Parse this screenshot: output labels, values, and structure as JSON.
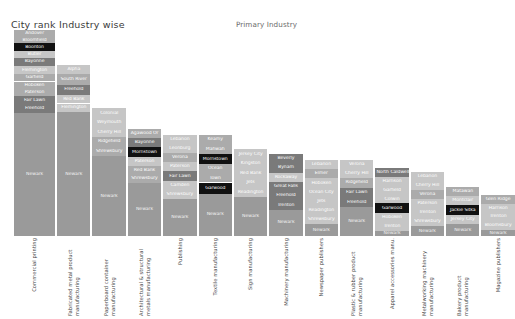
{
  "header": {
    "chart_title": "City rank Industry wise",
    "axis_title": "Primary Industry"
  },
  "chart_data": {
    "type": "bar",
    "title": "City rank Industry wise",
    "xlabel": "Primary Industry",
    "ylabel": "",
    "subtitle": "Primary Industry",
    "legend": "none",
    "grid": false,
    "note": "Stacked/mosaic column chart. Each column is one primary industry; segment heights are city shares and segment labels are city names. Column heights decline left to right.",
    "categories": [
      "Commercial printing",
      "Fabricated metal product manufacturing",
      "Paperboard container manufacturing",
      "Architectural & structural metals manufacturing",
      "Publishing",
      "Textile manufacturing",
      "Sign manufacturing",
      "Machinery manufacturing",
      "Newspaper publishers",
      "Plastic & rubber product manufacturing",
      "Apparel accessories manu.",
      "Metalworking machinery manufacturing",
      "Bakery product manufacturing",
      "Magazine publishers"
    ],
    "values": [
      100,
      83,
      62,
      52,
      49,
      49,
      42,
      40,
      37,
      37,
      33,
      31,
      24,
      20
    ],
    "ylim": [
      0,
      100
    ],
    "columns": [
      {
        "label": "Commercial printing",
        "height_pct": 100,
        "width_pct": 9.0,
        "segments": [
          {
            "city": "Andover",
            "pct": 3.4,
            "tone": "mid"
          },
          {
            "city": "Bloomfield",
            "pct": 3.0,
            "tone": "mid"
          },
          {
            "city": "Boonton",
            "pct": 4.0,
            "tone": "dark"
          },
          {
            "city": "Butler",
            "pct": 3.0,
            "tone": "light"
          },
          {
            "city": "Bayonne",
            "pct": 4.0,
            "tone": "mid-dark"
          },
          {
            "city": "Flemington",
            "pct": 4.0,
            "tone": "light"
          },
          {
            "city": "Garfield",
            "pct": 3.6,
            "tone": "mid"
          },
          {
            "city": "Hoboken",
            "pct": 3.6,
            "tone": "mid"
          },
          {
            "city": "Paterson",
            "pct": 3.6,
            "tone": "mid"
          },
          {
            "city": "Fair Lawn",
            "pct": 4.0,
            "tone": "mid-dark"
          },
          {
            "city": "Freehold",
            "pct": 4.0,
            "tone": "mid-dark"
          },
          {
            "city": "Newark",
            "pct": 59.8,
            "tone": "base"
          }
        ]
      },
      {
        "label": "Fabricated metal product manufacturing",
        "height_pct": 83,
        "width_pct": 7.3,
        "segments": [
          {
            "city": "Alpha",
            "pct": 5.0,
            "tone": "light"
          },
          {
            "city": "South River",
            "pct": 6.5,
            "tone": "mid"
          },
          {
            "city": "Freehold",
            "pct": 6.0,
            "tone": "mid-dark"
          },
          {
            "city": "Red Bank",
            "pct": 5.0,
            "tone": "light"
          },
          {
            "city": "Flemington",
            "pct": 5.0,
            "tone": "light"
          },
          {
            "city": "Newark",
            "pct": 72.5,
            "tone": "base"
          }
        ]
      },
      {
        "label": "Paperboard container manufacturing",
        "height_pct": 62,
        "width_pct": 7.3,
        "segments": [
          {
            "city": "Colonial",
            "pct": 7.5,
            "tone": "light"
          },
          {
            "city": "Weymouth",
            "pct": 7.5,
            "tone": "light"
          },
          {
            "city": "Cherry Hill",
            "pct": 7.5,
            "tone": "light"
          },
          {
            "city": "Ridgefield",
            "pct": 7.5,
            "tone": "mid"
          },
          {
            "city": "Shrewsbury",
            "pct": 7.5,
            "tone": "mid"
          },
          {
            "city": "Newark",
            "pct": 62.5,
            "tone": "base"
          }
        ]
      },
      {
        "label": "Architectural & structural metals manufacturing",
        "height_pct": 52,
        "width_pct": 7.3,
        "segments": [
          {
            "city": "Agawood Or",
            "pct": 8.5,
            "tone": "mid"
          },
          {
            "city": "Bayonne",
            "pct": 8.5,
            "tone": "mid-dark"
          },
          {
            "city": "Morristown",
            "pct": 9.0,
            "tone": "dark"
          },
          {
            "city": "Paterson",
            "pct": 8.5,
            "tone": "light"
          },
          {
            "city": "Red Bank",
            "pct": 8.0,
            "tone": "mid"
          },
          {
            "city": "Shrewsbury",
            "pct": 8.0,
            "tone": "mid"
          },
          {
            "city": "Newark",
            "pct": 49.5,
            "tone": "base"
          }
        ]
      },
      {
        "label": "Publishing",
        "height_pct": 49,
        "width_pct": 7.3,
        "segments": [
          {
            "city": "Lebanon",
            "pct": 9.0,
            "tone": "light"
          },
          {
            "city": "Leonburg",
            "pct": 9.0,
            "tone": "light"
          },
          {
            "city": "Verona",
            "pct": 9.0,
            "tone": "mid"
          },
          {
            "city": "Paterson",
            "pct": 9.0,
            "tone": "light"
          },
          {
            "city": "Fair Lawn",
            "pct": 9.5,
            "tone": "mid-dark"
          },
          {
            "city": "Camden",
            "pct": 9.0,
            "tone": "light"
          },
          {
            "city": "Shrewsbury",
            "pct": 9.0,
            "tone": "light"
          },
          {
            "city": "Newark",
            "pct": 36.5,
            "tone": "base"
          }
        ]
      },
      {
        "label": "Textile manufacturing",
        "height_pct": 49,
        "width_pct": 7.3,
        "segments": [
          {
            "city": "Keamy",
            "pct": 9.5,
            "tone": "mid"
          },
          {
            "city": "Mahwah",
            "pct": 9.5,
            "tone": "mid"
          },
          {
            "city": "Morristown",
            "pct": 10.0,
            "tone": "dark"
          },
          {
            "city": "Ocean",
            "pct": 9.0,
            "tone": "mid"
          },
          {
            "city": "Town",
            "pct": 9.0,
            "tone": "mid"
          },
          {
            "city": "Garwood",
            "pct": 11.0,
            "tone": "dark"
          },
          {
            "city": "Newark",
            "pct": 42.0,
            "tone": "base"
          }
        ]
      },
      {
        "label": "Sign manufacturing",
        "height_pct": 42,
        "width_pct": 7.3,
        "segments": [
          {
            "city": "Jersey City",
            "pct": 11.0,
            "tone": "light"
          },
          {
            "city": "Kingston",
            "pct": 11.0,
            "tone": "light"
          },
          {
            "city": "Red Bank",
            "pct": 11.0,
            "tone": "light"
          },
          {
            "city": "Jets",
            "pct": 11.0,
            "tone": "light"
          },
          {
            "city": "Readington",
            "pct": 11.0,
            "tone": "light"
          },
          {
            "city": "Newark",
            "pct": 45.0,
            "tone": "base"
          }
        ]
      },
      {
        "label": "Machinery manufacturing",
        "height_pct": 40,
        "width_pct": 7.3,
        "segments": [
          {
            "city": "Beverly",
            "pct": 11.5,
            "tone": "mid-dark"
          },
          {
            "city": "Bynam",
            "pct": 11.5,
            "tone": "mid-dark"
          },
          {
            "city": "Rockaway",
            "pct": 11.0,
            "tone": "light"
          },
          {
            "city": "Great Falls",
            "pct": 11.5,
            "tone": "mid-dark"
          },
          {
            "city": "Freehold",
            "pct": 11.5,
            "tone": "mid-dark"
          },
          {
            "city": "Trenton",
            "pct": 11.0,
            "tone": "mid-dark"
          },
          {
            "city": "Newark",
            "pct": 32.0,
            "tone": "base"
          }
        ]
      },
      {
        "label": "Newspaper publishers",
        "height_pct": 37,
        "width_pct": 7.3,
        "segments": [
          {
            "city": "Lebanon",
            "pct": 12.0,
            "tone": "light"
          },
          {
            "city": "Elmer",
            "pct": 12.5,
            "tone": "mid"
          },
          {
            "city": "Hoboken",
            "pct": 12.0,
            "tone": "light"
          },
          {
            "city": "Ocean City",
            "pct": 12.0,
            "tone": "light"
          },
          {
            "city": "Jets",
            "pct": 12.0,
            "tone": "light"
          },
          {
            "city": "Readington",
            "pct": 12.0,
            "tone": "light"
          },
          {
            "city": "Shrewsbury",
            "pct": 12.0,
            "tone": "light"
          },
          {
            "city": "Newark",
            "pct": 15.5,
            "tone": "base"
          }
        ]
      },
      {
        "label": "Plastic & rubber product manufacturing",
        "height_pct": 37,
        "width_pct": 7.3,
        "segments": [
          {
            "city": "Verona",
            "pct": 12.0,
            "tone": "light"
          },
          {
            "city": "Cherry Hill",
            "pct": 12.0,
            "tone": "light"
          },
          {
            "city": "Ridgefield",
            "pct": 12.5,
            "tone": "mid"
          },
          {
            "city": "Fair Lawn",
            "pct": 13.0,
            "tone": "mid-dark"
          },
          {
            "city": "Freehold",
            "pct": 13.0,
            "tone": "mid-dark"
          },
          {
            "city": "Newark",
            "pct": 37.5,
            "tone": "base"
          }
        ]
      },
      {
        "label": "Apparel accessories manu.",
        "height_pct": 33,
        "width_pct": 7.3,
        "segments": [
          {
            "city": "North Caldwell",
            "pct": 13.0,
            "tone": "mid-dark"
          },
          {
            "city": "Harrison",
            "pct": 13.0,
            "tone": "light"
          },
          {
            "city": "Garfield",
            "pct": 13.0,
            "tone": "light"
          },
          {
            "city": "Colwin",
            "pct": 13.0,
            "tone": "light"
          },
          {
            "city": "Garwood",
            "pct": 14.0,
            "tone": "dark"
          },
          {
            "city": "Hoboken",
            "pct": 13.0,
            "tone": "light"
          },
          {
            "city": "Trenton",
            "pct": 13.0,
            "tone": "light"
          },
          {
            "city": "Newark",
            "pct": 8.0,
            "tone": "base"
          }
        ]
      },
      {
        "label": "Metalworking machinery manufacturing",
        "height_pct": 31,
        "width_pct": 7.3,
        "segments": [
          {
            "city": "Lebanon",
            "pct": 14.0,
            "tone": "light"
          },
          {
            "city": "Cherry Hill",
            "pct": 14.0,
            "tone": "light"
          },
          {
            "city": "Verona",
            "pct": 14.5,
            "tone": "mid"
          },
          {
            "city": "Paterson",
            "pct": 14.0,
            "tone": "light"
          },
          {
            "city": "Trenton",
            "pct": 14.0,
            "tone": "light"
          },
          {
            "city": "Shrewsbury",
            "pct": 14.0,
            "tone": "light"
          },
          {
            "city": "Newark",
            "pct": 15.5,
            "tone": "base"
          }
        ]
      },
      {
        "label": "Bakery product manufacturing",
        "height_pct": 24,
        "width_pct": 7.3,
        "segments": [
          {
            "city": "Matawan",
            "pct": 19.0,
            "tone": "mid"
          },
          {
            "city": "Montclair",
            "pct": 18.5,
            "tone": "light"
          },
          {
            "city": "Jackie Sitka",
            "pct": 20.0,
            "tone": "dark"
          },
          {
            "city": "Jersey City",
            "pct": 19.0,
            "tone": "light"
          },
          {
            "city": "Newark",
            "pct": 23.5,
            "tone": "base"
          }
        ]
      },
      {
        "label": "Magazine publishers",
        "height_pct": 20,
        "width_pct": 7.3,
        "segments": [
          {
            "city": "Glen Ridge",
            "pct": 22.0,
            "tone": "mid"
          },
          {
            "city": "Harrison",
            "pct": 21.0,
            "tone": "light"
          },
          {
            "city": "Trenton",
            "pct": 21.0,
            "tone": "light"
          },
          {
            "city": "Bloomsbury",
            "pct": 21.0,
            "tone": "light"
          },
          {
            "city": "Newark",
            "pct": 15.0,
            "tone": "base"
          }
        ]
      }
    ],
    "palette": {
      "base": "#9a9a9a",
      "light": "#c6c6c6",
      "mid": "#ababab",
      "mid_dark": "#7a7a7a",
      "dark": "#111111",
      "text_on_light": "#ffffff",
      "text_on_dark": "#ffffff"
    }
  }
}
